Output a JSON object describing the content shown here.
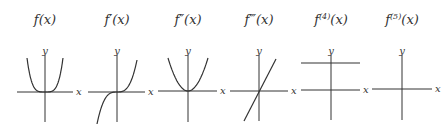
{
  "panels": [
    {
      "title": "f(x)",
      "title_main": "f",
      "title_sup": "",
      "title_arg": "(x)",
      "kind": "quartic",
      "cx": 45,
      "cy": 92,
      "x_left": 17,
      "x_right": 73,
      "y_top": 55,
      "y_bottom": 122
    },
    {
      "title": "f′(x)",
      "title_main": "f",
      "title_sup": "′",
      "title_arg": "(x)",
      "kind": "cubic",
      "cx": 117,
      "cy": 92,
      "x_left": 88,
      "x_right": 145,
      "y_top": 55,
      "y_bottom": 122
    },
    {
      "title": "f″(x)",
      "title_main": "f",
      "title_sup": "″",
      "title_arg": "(x)",
      "kind": "quadratic",
      "cx": 188,
      "cy": 91,
      "x_left": 158,
      "x_right": 217,
      "y_top": 55,
      "y_bottom": 122
    },
    {
      "title": "f‴(x)",
      "title_main": "f",
      "title_sup": "‴",
      "title_arg": "(x)",
      "kind": "linear",
      "cx": 259,
      "cy": 91,
      "x_left": 230,
      "x_right": 288,
      "y_top": 55,
      "y_bottom": 121
    },
    {
      "title": "f(4)(x)",
      "title_main": "f",
      "title_sup": "(4)",
      "title_arg": "(x)",
      "kind": "constant",
      "cx": 331,
      "cy": 90,
      "x_left": 301,
      "x_right": 360,
      "y_top": 55,
      "y_bottom": 120,
      "const_y": 63
    },
    {
      "title": "f(5)(x)",
      "title_main": "f",
      "title_sup": "(5)",
      "title_arg": "(x)",
      "kind": "zero",
      "cx": 402,
      "cy": 89,
      "x_left": 372,
      "x_right": 432,
      "y_top": 55,
      "y_bottom": 120
    }
  ],
  "axis_labels": {
    "x": "x",
    "y": "y"
  },
  "colors": {
    "ink": "#333333",
    "background": "#ffffff"
  }
}
